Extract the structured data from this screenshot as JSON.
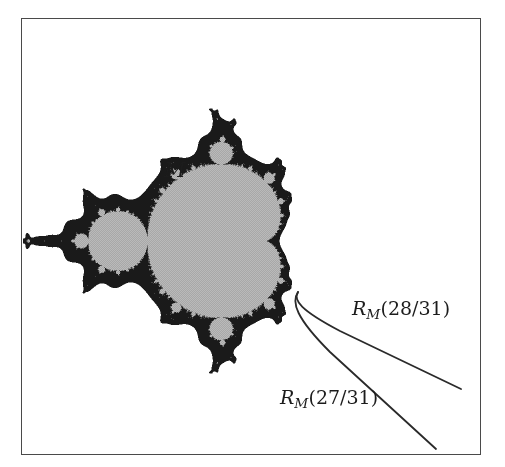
{
  "figure": {
    "background_color": "#ffffff",
    "frame_color": "#4a4a4a",
    "set_fill_color": "#b0b0b0",
    "set_boundary_color": "#1a1a1a",
    "ray_color": "#2a2a2a"
  },
  "labels": {
    "set": {
      "symbol": "M",
      "text": "M"
    },
    "ray_upper": {
      "symbol": "R",
      "subscript": "M",
      "open_paren": "(",
      "argument": "28/31",
      "close_paren": ")",
      "text": "R_M(28/31)"
    },
    "ray_lower": {
      "symbol": "R",
      "subscript": "M",
      "open_paren": "(",
      "argument": "27/31",
      "close_paren": ")",
      "text": "R_M(27/31)"
    }
  },
  "chart_data": {
    "type": "scatter",
    "xlabel": "",
    "ylabel": "",
    "grid": false,
    "legend": "none",
    "mandelbrot_view": {
      "x_center_px": 236,
      "y_center_px": 241,
      "scale_px_per_unit": 118,
      "xlim": [
        -2.2,
        0.75
      ],
      "ylim": [
        -1.3,
        1.3
      ],
      "max_iterations": 120
    },
    "rays": [
      {
        "name": "R_M(28/31)",
        "angle_fraction": "28/31",
        "landing_point_px": [
          298,
          292
        ],
        "end_point_px": [
          461,
          389
        ],
        "control_points_px": [
          [
            293,
            300
          ],
          [
            300,
            310
          ],
          [
            340,
            331
          ]
        ]
      },
      {
        "name": "R_M(27/31)",
        "angle_fraction": "27/31",
        "landing_point_px": [
          298,
          292
        ],
        "end_point_px": [
          436,
          449
        ],
        "control_points_px": [
          [
            291,
            302
          ],
          [
            296,
            318
          ],
          [
            330,
            352
          ]
        ]
      }
    ],
    "annotations": [
      {
        "text": "M",
        "position_px": [
          164,
          160
        ]
      },
      {
        "text": "R_M(28/31)",
        "position_px": [
          352,
          299
        ]
      },
      {
        "text": "R_M(27/31)",
        "position_px": [
          280,
          388
        ]
      }
    ]
  }
}
